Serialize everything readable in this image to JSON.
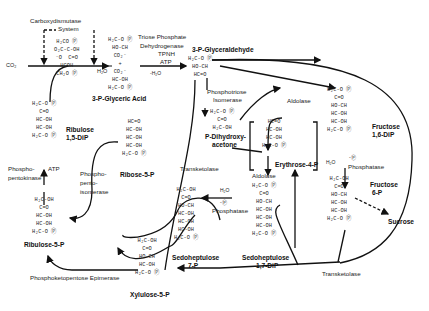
{
  "inputs": {
    "co2": "CO₂",
    "h2o": "H₂O"
  },
  "enzymes": {
    "carboxydismutase": "Carboxydismutase",
    "system": "System",
    "triose_dh": [
      "Triose Phosphate",
      "Dehydrogenase",
      "TPNH",
      "ATP"
    ],
    "minus_h2o": "-H₂O",
    "phosphotriose_isomerase": [
      "Phosphotriose",
      "Isomerase"
    ],
    "aldolase_top": "Aldolase",
    "aldolase_mid": "Aldolase",
    "phosphatase_right": "Phosphatase",
    "phosphatase_mid": "Phosphatase",
    "transketolase_mid": "Transketolase",
    "transketolase_bottom": "Transketolase",
    "phosphopentokinase": [
      "Phospho-",
      "pentokinase"
    ],
    "atp": "ATP",
    "phosphopentoisomerase": [
      "Phospho-",
      "pento-",
      "isomerase"
    ],
    "epimerase": "Phosphoketopentose Epimerase",
    "h2o_minus_p": [
      "H₂O",
      "-Ⓟ"
    ],
    "sucrose": "Sucrose"
  },
  "compounds": {
    "intermediate": {
      "name": "",
      "lines": [
        "H₂CO Ⓟ",
        "O₂C-C-OH",
        "⁻O  C=O",
        "HCOH",
        "CH₂O Ⓟ"
      ]
    },
    "pga": {
      "name": "3-P-Glyceric Acid",
      "lines": [
        "H₂C-O Ⓟ",
        "HO-CH",
        "CO₂⁻",
        "+",
        "CO₂⁻",
        "HC-OH",
        "H₂C-O Ⓟ"
      ]
    },
    "gap": {
      "name": "3-P-Glyceraldehyde",
      "lines": [
        "H₂C-O Ⓟ",
        "HO-CH",
        "HC=O"
      ]
    },
    "dhap": {
      "name": "P-Dihydroxy-acetone",
      "name_lines": [
        "P-Dihydroxy-",
        "acetone"
      ],
      "lines": [
        "H₂C-O Ⓟ",
        "C=O",
        "H₂C-OH"
      ]
    },
    "fdp": {
      "name": "Fructose 1,6-DiP",
      "name_lines": [
        "Fructose",
        "1,6-DiP"
      ],
      "lines": [
        "H₂C-O Ⓟ",
        "C=O",
        "HO-CH",
        "HC-OH",
        "HC-OH",
        "H₂C-O Ⓟ"
      ]
    },
    "f6p": {
      "name": "Fructose 6-P",
      "name_lines": [
        "Fructose",
        "6-P"
      ],
      "lines": [
        "H₂C-OH",
        "C=O",
        "HO-CH",
        "HC-OH",
        "HC-OH",
        "H₂C-O Ⓟ"
      ]
    },
    "e4p": {
      "name": "Erythrose-4-P",
      "lines": [
        "HC=O",
        "HC-OH",
        "HC-OH",
        "H₂C-O Ⓟ"
      ]
    },
    "sdp": {
      "name": "Sedoheptulose 1,7-DiP",
      "name_lines": [
        "Sedoheptulose",
        "1,7-DiP"
      ],
      "lines": [
        "H₂C-O Ⓟ",
        "C=O",
        "HO-CH",
        "HC-OH",
        "HC-OH",
        "HC-OH",
        "H₂C-O Ⓟ"
      ]
    },
    "s7p": {
      "name": "Sedoheptulose 7-P",
      "name_lines": [
        "Sedoheptulose",
        "7-P"
      ],
      "lines": [
        "H₂C-OH",
        "C=O",
        "HO-CH",
        "HC-OH",
        "HC-OH",
        "HC-OH",
        "H₂C-O Ⓟ"
      ]
    },
    "r5p": {
      "name": "Ribose-5-P",
      "lines": [
        "HC=O",
        "HC-OH",
        "HC-OH",
        "HC-OH",
        "H₂C-O Ⓟ"
      ]
    },
    "ru5p": {
      "name": "Ribulose-5-P",
      "lines": [
        "H₂C-OH",
        "C=O",
        "HC-OH",
        "HC-OH",
        "H₂C-O Ⓟ"
      ]
    },
    "rudp": {
      "name": "Ribulose 1,5-DiP",
      "name_lines": [
        "Ribulose",
        "1,5-DiP"
      ],
      "lines": [
        "H₂C-O Ⓟ",
        "C=O",
        "HC-OH",
        "HC-OH",
        "H₂C-O Ⓟ"
      ]
    },
    "xu5p": {
      "name": "Xylulose-5-P",
      "lines": [
        "H₂C-OH",
        "C=O",
        "HO-CH",
        "HC-OH",
        "H₂C-O Ⓟ"
      ]
    }
  }
}
